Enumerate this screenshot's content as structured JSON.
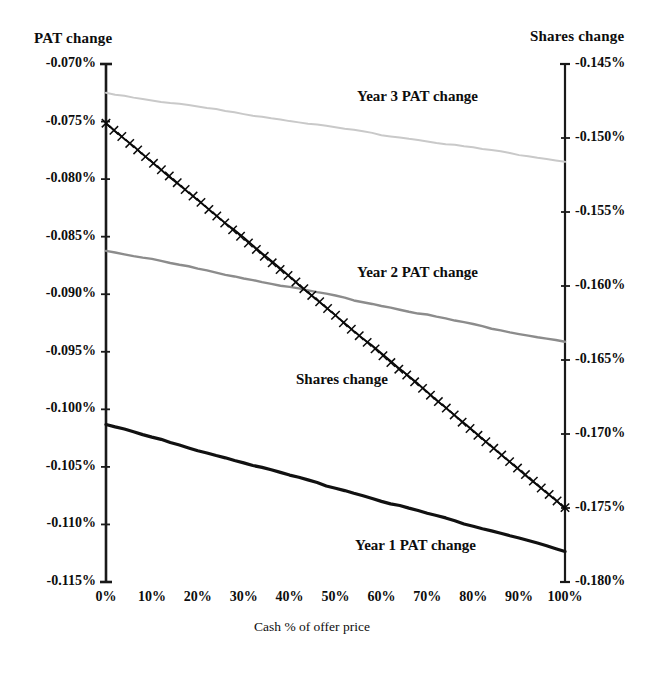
{
  "figure": {
    "left_axis_title": "PAT  change",
    "right_axis_title": "Shares  change",
    "x_axis_title": "Cash % of offer price",
    "series_labels": {
      "year3": "Year 3 PAT  change",
      "year2": "Year 2 PAT  change",
      "year1": "Year 1 PAT  change",
      "shares": "Shares change"
    }
  },
  "colors": {
    "year1": "#111111",
    "year2": "#8c8c8c",
    "year3": "#c9c9c9",
    "shares": "#0a0a0a",
    "axis": "#1a1a1a",
    "background": "#ffffff"
  },
  "chart_data": {
    "type": "line",
    "title": "",
    "xlabel": "Cash % of offer price",
    "ylabel": "PAT  change",
    "y2label": "Shares  change",
    "grid": false,
    "legend": "inline-annotations",
    "x": [
      0,
      10,
      20,
      30,
      40,
      50,
      60,
      70,
      80,
      90,
      100
    ],
    "xtick_labels": [
      "0%",
      "10%",
      "20%",
      "30%",
      "40%",
      "50%",
      "60%",
      "70%",
      "80%",
      "90%",
      "100%"
    ],
    "xlim": [
      0,
      100
    ],
    "ylim": [
      -0.115,
      -0.07
    ],
    "ytick_labels": [
      "-0.070%",
      "-0.075%",
      "-0.080%",
      "-0.085%",
      "-0.090%",
      "-0.095%",
      "-0.100%",
      "-0.105%",
      "-0.110%",
      "-0.115%"
    ],
    "ytick_values": [
      -0.07,
      -0.075,
      -0.08,
      -0.085,
      -0.09,
      -0.095,
      -0.1,
      -0.105,
      -0.11,
      -0.115
    ],
    "y2lim": [
      -0.18,
      -0.145
    ],
    "y2tick_labels": [
      "-0.145%",
      "-0.150%",
      "-0.155%",
      "-0.160%",
      "-0.165%",
      "-0.170%",
      "-0.175%",
      "-0.180%"
    ],
    "y2tick_values": [
      -0.145,
      -0.15,
      -0.155,
      -0.16,
      -0.165,
      -0.17,
      -0.175,
      -0.18
    ],
    "series": [
      {
        "name": "Year 3 PAT  change",
        "axis": "left",
        "color": "#c9c9c9",
        "width": 2.0,
        "marker": "none",
        "values": [
          -0.0725,
          -0.0731,
          -0.0737,
          -0.0743,
          -0.0749,
          -0.0755,
          -0.0761,
          -0.0767,
          -0.0773,
          -0.0779,
          -0.0785
        ]
      },
      {
        "name": "Year 2 PAT  change",
        "axis": "left",
        "color": "#8c8c8c",
        "width": 2.4,
        "marker": "none",
        "values": [
          -0.0862,
          -0.087,
          -0.0878,
          -0.0886,
          -0.0894,
          -0.0902,
          -0.091,
          -0.0918,
          -0.0926,
          -0.0934,
          -0.0941
        ]
      },
      {
        "name": "Year 1 PAT  change",
        "axis": "left",
        "color": "#111111",
        "width": 3.2,
        "marker": "none",
        "values": [
          -0.1013,
          -0.1024,
          -0.1035,
          -0.1046,
          -0.1057,
          -0.1068,
          -0.1079,
          -0.109,
          -0.1101,
          -0.1112,
          -0.1124
        ]
      },
      {
        "name": "Shares change",
        "axis": "right",
        "color": "#0a0a0a",
        "width": 1.8,
        "marker": "x",
        "values": [
          -0.149,
          -0.1516,
          -0.1542,
          -0.1568,
          -0.1594,
          -0.162,
          -0.1646,
          -0.1672,
          -0.1698,
          -0.1724,
          -0.175
        ]
      }
    ]
  }
}
